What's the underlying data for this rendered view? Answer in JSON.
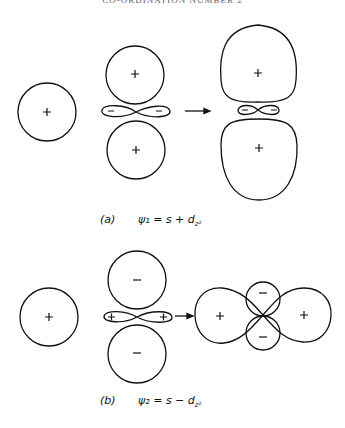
{
  "header": "CO-ORDINATION NUMBER 2",
  "panel_a": {
    "label": "(a)",
    "equation": "ψ₁ = s + d",
    "sub": "z²",
    "s_sign": "+",
    "dz2_lobe_signs": [
      "+",
      "+"
    ],
    "dz2_ring_signs": [
      "−",
      "−"
    ],
    "hybrid_lobe_signs": [
      "+",
      "+"
    ],
    "hybrid_ring_signs": [
      "−",
      "−"
    ]
  },
  "panel_b": {
    "label": "(b)",
    "equation": "ψ₂ = s − d",
    "sub": "z²",
    "s_sign": "+",
    "dz2_lobe_signs": [
      "−",
      "−"
    ],
    "dz2_ring_signs": [
      "+",
      "+"
    ],
    "hybrid_lobe_signs": [
      "+",
      "+"
    ],
    "hybrid_small_signs": [
      "−",
      "−"
    ]
  }
}
